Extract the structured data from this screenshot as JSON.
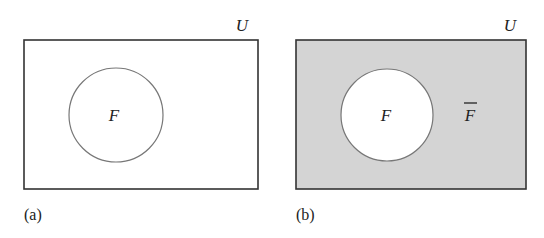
{
  "diagrams": [
    {
      "id": "a",
      "caption": "(a)",
      "universe_label": "U",
      "set_label": "F",
      "shaded_region": "none",
      "colors": {
        "background": "#ffffff",
        "circle_fill": "#ffffff"
      }
    },
    {
      "id": "b",
      "caption": "(b)",
      "universe_label": "U",
      "set_label": "F",
      "complement_label": "F",
      "complement_overbar": true,
      "shaded_region": "complement of F",
      "colors": {
        "background": "#d4d4d4",
        "circle_fill": "#ffffff"
      }
    }
  ],
  "colors": {
    "stroke": "#333333",
    "circle_stroke": "#777777",
    "text": "#222222"
  }
}
